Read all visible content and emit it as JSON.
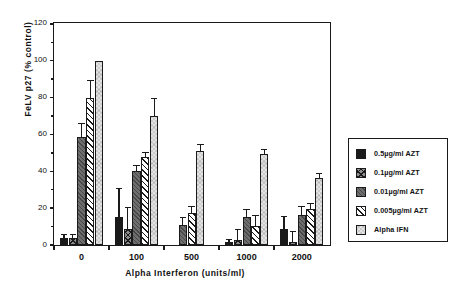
{
  "chart_data": {
    "type": "bar",
    "title": "",
    "xlabel": "Alpha   Interferon   (units/ml)",
    "ylabel": "FeLV p27  (%  control)",
    "categories": [
      "0",
      "100",
      "500",
      "1000",
      "2000"
    ],
    "ylim": [
      0,
      120
    ],
    "yticks": [
      0,
      20,
      40,
      60,
      80,
      100,
      120
    ],
    "yticks_minor": [
      10,
      30,
      50,
      70,
      90,
      110
    ],
    "grid": false,
    "legend_position": "right-outside",
    "series": [
      {
        "name": "0.5µg/ml AZT",
        "pattern": "solid-black",
        "values": [
          4.0,
          15.0,
          null,
          1.5,
          8.5
        ],
        "errors": [
          1.5,
          15.5,
          null,
          1.2,
          6.5
        ]
      },
      {
        "name": "0.1µg/ml AZT",
        "pattern": "crosshatch",
        "values": [
          4.0,
          8.5,
          null,
          2.5,
          1.5
        ],
        "errors": [
          1.5,
          11.5,
          null,
          5.5,
          5.5
        ]
      },
      {
        "name": "0.01µg/ml AZT",
        "pattern": "gray-fill",
        "values": [
          58.5,
          40.0,
          11.0,
          15.0,
          16.5
        ],
        "errors": [
          7.0,
          3.0,
          3.5,
          4.0,
          4.0
        ]
      },
      {
        "name": "0.005µg/ml AZT",
        "pattern": "diagonal-hatch",
        "values": [
          80.0,
          47.5,
          17.5,
          10.5,
          19.5
        ],
        "errors": [
          9.0,
          2.5,
          3.0,
          5.0,
          2.5
        ]
      },
      {
        "name": "Alpha IFN",
        "pattern": "light-fill",
        "values": [
          100.0,
          70.0,
          51.0,
          49.5,
          36.5
        ],
        "errors": [
          0.0,
          9.0,
          3.0,
          2.0,
          2.0
        ]
      }
    ]
  },
  "legend": {
    "items": [
      {
        "label": "0.5µg/ml AZT"
      },
      {
        "label": "0.1µg/ml AZT"
      },
      {
        "label": "0.01µg/ml AZT"
      },
      {
        "label": "0.005µg/ml AZT"
      },
      {
        "label": "Alpha IFN"
      }
    ]
  },
  "colors": {
    "axis": "#1a1a1a",
    "background": "#ffffff",
    "series_solid": "#1a1a1a",
    "series_gray": "#6e6e6e",
    "series_light": "#e3e3e3"
  }
}
